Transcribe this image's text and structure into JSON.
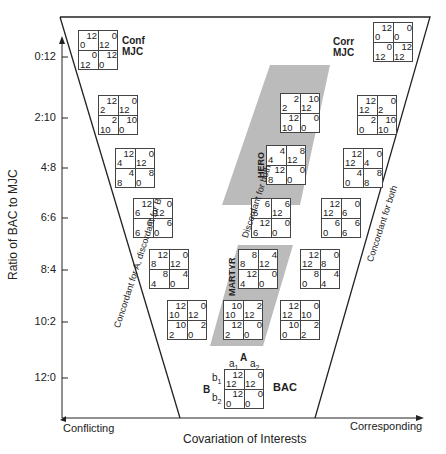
{
  "axes": {
    "y_label": "Ratio of BAC to MJC",
    "x_label": "Covariation of Interests",
    "x_left": "Conflicting",
    "x_right": "Corresponding",
    "y_ticks": [
      "0:12",
      "2:10",
      "4:8",
      "6:6",
      "8:4",
      "10:2",
      "12:0"
    ]
  },
  "labels": {
    "conf_mjc_1": "Conf",
    "conf_mjc_2": "MJC",
    "corr_mjc_1": "Corr",
    "corr_mjc_2": "MJC",
    "hero": "HERO",
    "martyr": "MARTYR",
    "bac": "BAC",
    "left_diag": "Concordant for A, discordant for B",
    "middle_diag": "Discordant for both",
    "right_diag": "Concordant for both",
    "bac_A": "A",
    "bac_B": "B",
    "bac_a1": "a1",
    "bac_a2": "a2",
    "bac_b1": "b1",
    "bac_b2": "b2"
  },
  "matrices": {
    "conf_mjc": [
      [
        "12",
        "0"
      ],
      [
        "0",
        "12"
      ],
      [
        "0",
        "12"
      ],
      [
        "12",
        "0"
      ]
    ],
    "left_2_10": [
      [
        "12",
        "2"
      ],
      [
        "0",
        "12"
      ],
      [
        "2",
        "10"
      ],
      [
        "10",
        "0"
      ]
    ],
    "left_4_8": [
      [
        "12",
        "4"
      ],
      [
        "0",
        "12"
      ],
      [
        "4",
        "8"
      ],
      [
        "8",
        "0"
      ]
    ],
    "left_6_6": [
      [
        "12",
        "6"
      ],
      [
        "0",
        "12"
      ],
      [
        "6",
        "6"
      ],
      [
        "6",
        "0"
      ]
    ],
    "left_8_4": [
      [
        "12",
        "8"
      ],
      [
        "0",
        "12"
      ],
      [
        "8",
        "4"
      ],
      [
        "4",
        "0"
      ]
    ],
    "left_10_2": [
      [
        "12",
        "10"
      ],
      [
        "0",
        "12"
      ],
      [
        "10",
        "2"
      ],
      [
        "2",
        "0"
      ]
    ],
    "mid_2_10": [
      [
        "2",
        "2"
      ],
      [
        "10",
        "12"
      ],
      [
        "12",
        "10"
      ],
      [
        "0",
        "0"
      ]
    ],
    "hero_4_8": [
      [
        "4",
        "4"
      ],
      [
        "8",
        "12"
      ],
      [
        "12",
        "8"
      ],
      [
        "0",
        "0"
      ]
    ],
    "mid_6_6": [
      [
        "6",
        "6"
      ],
      [
        "6",
        "12"
      ],
      [
        "12",
        "6"
      ],
      [
        "0",
        "0"
      ]
    ],
    "martyr_8_4": [
      [
        "8",
        "8"
      ],
      [
        "4",
        "12"
      ],
      [
        "12",
        "4"
      ],
      [
        "0",
        "0"
      ]
    ],
    "mid_10_2": [
      [
        "10",
        "10"
      ],
      [
        "2",
        "12"
      ],
      [
        "12",
        "2"
      ],
      [
        "0",
        "0"
      ]
    ],
    "right_2_10": [
      [
        "12",
        "12"
      ],
      [
        "0",
        "2"
      ],
      [
        "2",
        "0"
      ],
      [
        "10",
        "10"
      ]
    ],
    "right_4_8": [
      [
        "12",
        "12"
      ],
      [
        "0",
        "4"
      ],
      [
        "4",
        "0"
      ],
      [
        "8",
        "8"
      ]
    ],
    "right_6_6": [
      [
        "12",
        "12"
      ],
      [
        "0",
        "6"
      ],
      [
        "6",
        "0"
      ],
      [
        "6",
        "6"
      ]
    ],
    "right_8_4": [
      [
        "12",
        "12"
      ],
      [
        "0",
        "8"
      ],
      [
        "8",
        "0"
      ],
      [
        "4",
        "4"
      ]
    ],
    "right_10_2": [
      [
        "12",
        "12"
      ],
      [
        "0",
        "10"
      ],
      [
        "10",
        "0"
      ],
      [
        "2",
        "2"
      ]
    ],
    "bac": [
      [
        "12",
        "12"
      ],
      [
        "0",
        "12"
      ],
      [
        "12",
        "0"
      ],
      [
        "0",
        "0"
      ]
    ],
    "corr_mjc": [
      [
        "12",
        "12"
      ],
      [
        "0",
        "0"
      ],
      [
        "0",
        "0"
      ],
      [
        "12",
        "12"
      ]
    ]
  }
}
